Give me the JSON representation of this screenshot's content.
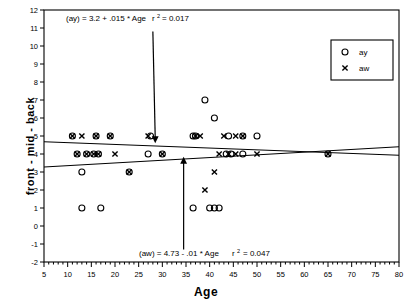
{
  "chart_data": {
    "type": "scatter",
    "title": "",
    "xlabel": "Age",
    "ylabel": "front  -  mid  -  back",
    "xlim": [
      5,
      80
    ],
    "ylim": [
      -2,
      12
    ],
    "xticks": [
      5,
      10,
      15,
      20,
      25,
      30,
      35,
      40,
      45,
      50,
      55,
      60,
      65,
      70,
      75,
      80
    ],
    "yticks": [
      -2,
      -1,
      0,
      1,
      2,
      3,
      4,
      5,
      6,
      7,
      8,
      9,
      10,
      11,
      12
    ],
    "grid": false,
    "legend_position": "top-right",
    "series": [
      {
        "name": "ay",
        "marker": "circle",
        "points": [
          [
            11,
            5
          ],
          [
            16,
            5
          ],
          [
            19,
            5
          ],
          [
            27.5,
            5
          ],
          [
            36.5,
            5
          ],
          [
            37,
            5
          ],
          [
            44,
            5
          ],
          [
            47,
            5
          ],
          [
            50,
            5
          ],
          [
            39,
            7
          ],
          [
            41,
            6
          ],
          [
            12,
            4
          ],
          [
            14,
            4
          ],
          [
            15.5,
            4
          ],
          [
            16.5,
            4
          ],
          [
            27,
            4
          ],
          [
            30,
            4
          ],
          [
            43.5,
            4
          ],
          [
            44.5,
            4
          ],
          [
            47,
            4
          ],
          [
            65,
            4
          ],
          [
            13,
            3
          ],
          [
            23,
            3
          ],
          [
            13,
            1
          ],
          [
            17,
            1
          ],
          [
            36.5,
            1
          ],
          [
            40,
            1
          ],
          [
            41,
            1
          ],
          [
            42,
            1
          ]
        ]
      },
      {
        "name": "aw",
        "marker": "x",
        "points": [
          [
            11,
            5
          ],
          [
            13,
            5
          ],
          [
            16,
            5
          ],
          [
            19,
            5
          ],
          [
            27,
            5
          ],
          [
            37,
            5
          ],
          [
            38,
            5
          ],
          [
            43,
            5
          ],
          [
            45.5,
            5
          ],
          [
            47,
            5
          ],
          [
            12,
            4
          ],
          [
            14,
            4
          ],
          [
            15.5,
            4
          ],
          [
            16.5,
            4
          ],
          [
            20,
            4
          ],
          [
            30,
            4
          ],
          [
            42,
            4
          ],
          [
            44,
            4
          ],
          [
            45.5,
            4
          ],
          [
            50,
            4
          ],
          [
            65,
            4
          ],
          [
            23,
            3
          ],
          [
            41,
            3
          ],
          [
            39,
            2
          ]
        ]
      }
    ],
    "trendlines": [
      {
        "name": "ay",
        "intercept": 3.2,
        "slope": 0.015,
        "r2": 0.017,
        "label": "(ay) = 3.2 + .015 * Age",
        "r2_label": "0.017"
      },
      {
        "name": "aw",
        "intercept": 4.73,
        "slope": -0.01,
        "r2": 0.047,
        "label": "(aw) = 4.73 - .01 * Age",
        "r2_label": "0.047"
      }
    ],
    "annotations": [
      {
        "id": "ay-annotation",
        "text": "(ay) = 3.2 + .015 * Age",
        "r_prefix": "r",
        "r_exponent": "2",
        "r_value": "= 0.017",
        "arrow_from": [
          28,
          10.8
        ],
        "arrow_to": [
          28.5,
          4.6
        ]
      },
      {
        "id": "aw-annotation",
        "text": "(aw) = 4.73 - .01 * Age",
        "r_prefix": "r",
        "r_exponent": "2",
        "r_value": "= 0.047",
        "arrow_from": [
          34.5,
          -1.3
        ],
        "arrow_to": [
          34.5,
          3.85
        ]
      }
    ],
    "legend": {
      "entries": [
        {
          "label": "ay",
          "marker": "circle"
        },
        {
          "label": "aw",
          "marker": "x"
        }
      ]
    },
    "colors": {
      "axis": "#000000",
      "marker": "#000000",
      "trendline": "#000000",
      "background": "#ffffff"
    }
  }
}
